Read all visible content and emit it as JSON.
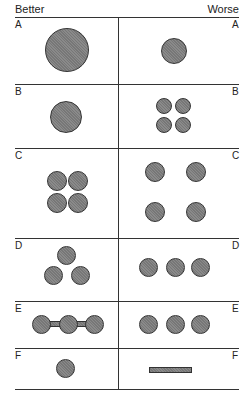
{
  "header": {
    "left": "Better",
    "right": "Worse"
  },
  "rows": [
    {
      "label": "A",
      "better": "one large circle",
      "worse": "one small circle"
    },
    {
      "label": "B",
      "better": "one circle",
      "worse": "four small circles in 2x2 grid"
    },
    {
      "label": "C",
      "better": "four circles clustered 2x2",
      "worse": "four circles spread apart"
    },
    {
      "label": "D",
      "better": "three circles in triangle",
      "worse": "three circles in a row"
    },
    {
      "label": "E",
      "better": "three circles connected by bars",
      "worse": "three circles in a row"
    },
    {
      "label": "F",
      "better": "one circle",
      "worse": "horizontal bar"
    }
  ],
  "colors": {
    "fill": "#808080",
    "stroke": "#333333",
    "line": "#333333"
  }
}
